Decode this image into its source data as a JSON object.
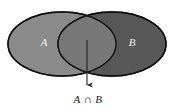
{
  "figure": {
    "background_color": "#ffffff"
  },
  "sets": {
    "left": {
      "label": "A",
      "fill_color": "#8b8b8b",
      "label_color": "#efefef",
      "stroke_color": "#111111"
    },
    "right": {
      "label": "B",
      "fill_color": "#585858",
      "label_color": "#e0e0e0",
      "stroke_color": "#111111"
    },
    "intersection": {
      "label": "A ∩ B",
      "fill_color": "#787878",
      "stroke_color": "#111111"
    }
  },
  "annotation": {
    "caption": "A ∩ B",
    "caption_color": "#222222",
    "arrow_color": "#222222",
    "arrow_points_to": "intersection"
  }
}
